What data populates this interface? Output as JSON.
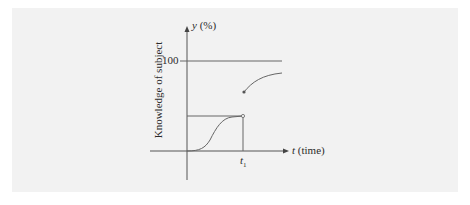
{
  "diagram": {
    "y_axis_label": "y (%)",
    "y_axis_var": "y",
    "y_axis_unit": "(%)",
    "x_axis_var": "t",
    "x_axis_unit": "(time)",
    "vertical_title": "Knowledge of subject",
    "tick_100": "100",
    "t1_var": "t",
    "t1_sub": "1",
    "colors": {
      "background": "#f2f2f2",
      "lines": "#555555",
      "text": "#2a2a2a"
    }
  }
}
